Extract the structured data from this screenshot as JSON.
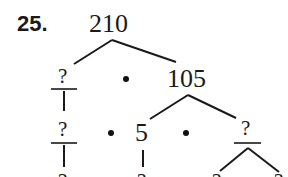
{
  "problem": {
    "number": "25.",
    "root": "210",
    "level1": {
      "left": "?",
      "operator": "•",
      "right": "105"
    },
    "level2": {
      "left": "?",
      "operator1": "•",
      "middle": "5",
      "operator2": "•",
      "right": "?"
    },
    "level3": {
      "items": [
        "?",
        "?",
        "?",
        "?"
      ]
    }
  },
  "colors": {
    "ink": "#1a1a1a",
    "background": "#ffffff"
  }
}
